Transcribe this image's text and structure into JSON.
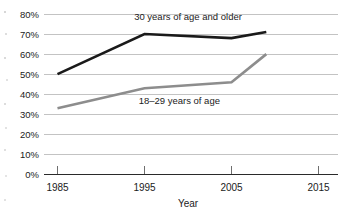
{
  "figure": {
    "caption": "FIGURE 5-2"
  },
  "chart_data": {
    "type": "line",
    "title": "",
    "xlabel": "Year",
    "ylabel": "",
    "xlim": [
      1985,
      2015
    ],
    "ylim": [
      0,
      80
    ],
    "grid": true,
    "legend_position": "inline-labels",
    "x_tick_labels": [
      "1985",
      "1995",
      "2005",
      "2015"
    ],
    "x_ticks": [
      1985,
      1995,
      2005,
      2015
    ],
    "y_tick_labels": [
      "0%",
      "10%",
      "20%",
      "30%",
      "40%",
      "50%",
      "60%",
      "70%",
      "80%"
    ],
    "y_ticks": [
      0,
      10,
      20,
      30,
      40,
      50,
      60,
      70,
      80
    ],
    "series": [
      {
        "name": "30 years of age and older",
        "color": "#1a1a1a",
        "stroke_width": 2.6,
        "x": [
          1985,
          1995,
          2005,
          2009
        ],
        "values": [
          50,
          70,
          68,
          71
        ],
        "label_x": 2000,
        "label_y": 77
      },
      {
        "name": "18–29 years of age",
        "color": "#8d8d8d",
        "stroke_width": 2.6,
        "x": [
          1985,
          1995,
          2005,
          2009
        ],
        "values": [
          33,
          43,
          46,
          60
        ],
        "label_x": 1999,
        "label_y": 35
      }
    ]
  }
}
